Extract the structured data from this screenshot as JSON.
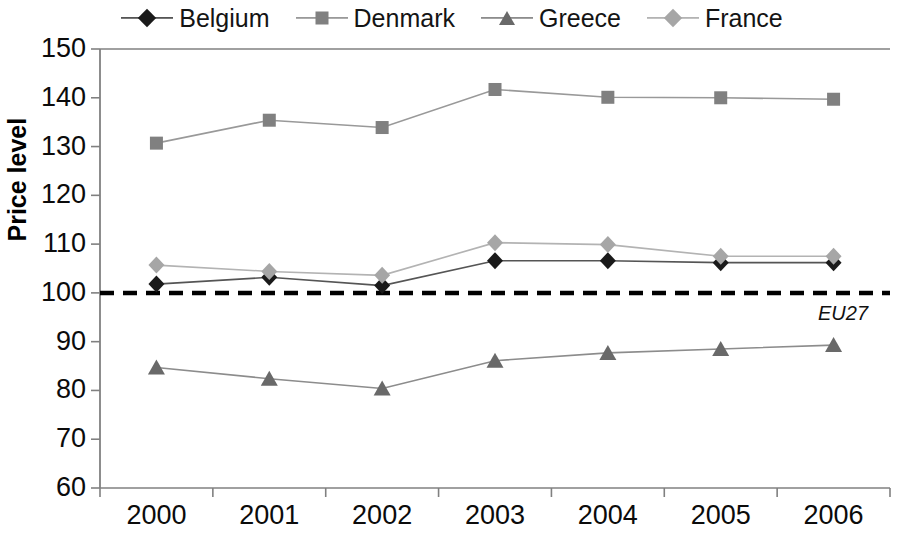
{
  "chart_data": {
    "type": "line",
    "title": "",
    "subtitle": "",
    "xlabel": "",
    "ylabel": "Price level",
    "categories": [
      "2000",
      "2001",
      "2002",
      "2003",
      "2004",
      "2005",
      "2006"
    ],
    "x": [
      2000,
      2001,
      2002,
      2003,
      2004,
      2005,
      2006
    ],
    "ylim": [
      60,
      150
    ],
    "yticks": [
      60,
      70,
      80,
      90,
      100,
      110,
      120,
      130,
      140,
      150
    ],
    "ytick_labels": [
      "60",
      "70",
      "80",
      "90",
      "100",
      "110",
      "120",
      "130",
      "140",
      "150"
    ],
    "grid": false,
    "legend_position": "top",
    "series": [
      {
        "name": "Belgium",
        "marker": "diamond",
        "color": "#1a1a1a",
        "line_color": "#555555",
        "values": [
          101.8,
          103.2,
          101.5,
          106.6,
          106.6,
          106.2,
          106.2
        ]
      },
      {
        "name": "Denmark",
        "marker": "square",
        "color": "#808080",
        "line_color": "#999999",
        "values": [
          130.7,
          135.4,
          133.9,
          141.7,
          140.1,
          140.0,
          139.7
        ]
      },
      {
        "name": "Greece",
        "marker": "triangle",
        "color": "#696969",
        "line_color": "#8c8c8c",
        "values": [
          84.7,
          82.4,
          80.4,
          86.1,
          87.7,
          88.5,
          89.3
        ]
      },
      {
        "name": "France",
        "marker": "diamond",
        "color": "#a6a6a6",
        "line_color": "#b3b3b3",
        "values": [
          105.7,
          104.4,
          103.6,
          110.3,
          109.9,
          107.5,
          107.5
        ]
      }
    ],
    "reference_line": {
      "value": 100,
      "label": "EU27",
      "style": "dashed",
      "color": "#000000"
    }
  },
  "legend": {
    "items": [
      {
        "label": "Belgium"
      },
      {
        "label": "Denmark"
      },
      {
        "label": "Greece"
      },
      {
        "label": "France"
      }
    ]
  },
  "axis": {
    "y_title": "Price level"
  }
}
